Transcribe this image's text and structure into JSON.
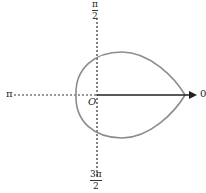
{
  "diagram": {
    "type": "polar-curve",
    "labels": {
      "angle_0": "0",
      "angle_pi": "π",
      "angle_pi_over_2": {
        "numerator": "π",
        "denominator": "2"
      },
      "angle_3pi_over_2": {
        "numerator": "3π",
        "denominator": "2"
      },
      "origin": "O"
    },
    "colors": {
      "curve": "#8c8c8c",
      "axis": "#222222",
      "polar_axis": "#222222"
    }
  }
}
